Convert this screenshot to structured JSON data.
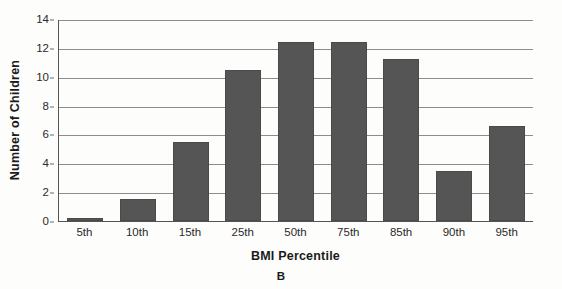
{
  "chart_data": {
    "type": "bar",
    "title": "",
    "panel_label": "B",
    "xlabel": "BMI Percentile",
    "ylabel": "Number of Children",
    "categories": [
      "5th",
      "10th",
      "15th",
      "25th",
      "50th",
      "75th",
      "85th",
      "90th",
      "95th"
    ],
    "values": [
      0.2,
      1.5,
      5.5,
      10.45,
      12.4,
      12.4,
      11.2,
      3.5,
      6.6
    ],
    "ylim": [
      0,
      14
    ],
    "ytick_labels": [
      "0",
      "2",
      "4",
      "6",
      "8",
      "10",
      "12",
      "14"
    ],
    "ytick_values": [
      0,
      2,
      4,
      6,
      8,
      10,
      12,
      14
    ],
    "grid": "horizontal",
    "legend": "none",
    "bar_color": "#555555",
    "gridline_color": "#8c8c8c",
    "axis_color": "#555555",
    "background_color": "#fdfdfc"
  }
}
